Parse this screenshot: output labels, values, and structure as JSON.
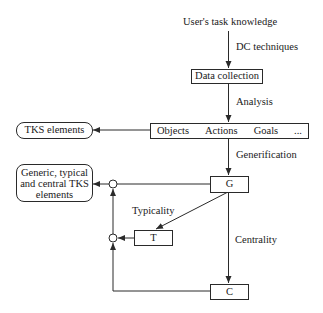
{
  "diagram": {
    "source": "User's task knowledge",
    "edges": {
      "dc_techniques": "DC techniques",
      "analysis": "Analysis",
      "generification": "Generification",
      "typicality": "Typicality",
      "centrality": "Centrality"
    },
    "nodes": {
      "data_collection": "Data collection",
      "elements_row": [
        "Objects",
        "Actions",
        "Goals",
        "..."
      ],
      "tks_elements": "TKS elements",
      "g": "G",
      "t": "T",
      "c": "C",
      "output": [
        "Generic, typical",
        "and central TKS",
        "elements"
      ]
    }
  }
}
